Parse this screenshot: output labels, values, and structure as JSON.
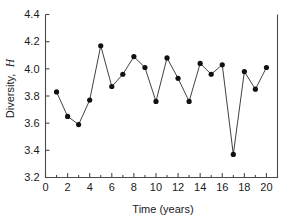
{
  "chart_data": {
    "type": "line",
    "title": "",
    "xlabel": "Time (years)",
    "ylabel": "Diversity, H",
    "ylabel_plain": "Diversity,",
    "ylabel_italic": "H",
    "x": [
      1,
      2,
      3,
      4,
      5,
      6,
      7,
      8,
      9,
      10,
      11,
      12,
      13,
      14,
      15,
      16,
      17,
      18,
      19,
      20
    ],
    "values": [
      3.83,
      3.65,
      3.59,
      3.77,
      4.17,
      3.87,
      3.96,
      4.09,
      4.01,
      3.76,
      4.08,
      3.93,
      3.76,
      4.04,
      3.96,
      4.03,
      3.37,
      3.98,
      3.85,
      4.01
    ],
    "xlim": [
      0,
      21
    ],
    "ylim": [
      3.2,
      4.4
    ],
    "xticks": [
      0,
      2,
      4,
      6,
      8,
      10,
      12,
      14,
      16,
      18,
      20
    ],
    "xtick_labels": [
      "0",
      "2",
      "4",
      "6",
      "8",
      "10",
      "12",
      "14",
      "16",
      "18",
      "20"
    ],
    "xticks_minor": [
      1,
      3,
      5,
      7,
      9,
      11,
      13,
      15,
      17,
      19,
      21
    ],
    "yticks": [
      3.2,
      3.4,
      3.6,
      3.8,
      4.0,
      4.2,
      4.4
    ],
    "ytick_labels": [
      "3.2",
      "3.4",
      "3.6",
      "3.8",
      "4.0",
      "4.2",
      "4.4"
    ],
    "grid": false,
    "legend": null,
    "marker": "filled-circle",
    "marker_color": "#111111",
    "line_color": "#2b2b2b",
    "axis_color": "#4a4a4a",
    "background": "#ffffff"
  }
}
